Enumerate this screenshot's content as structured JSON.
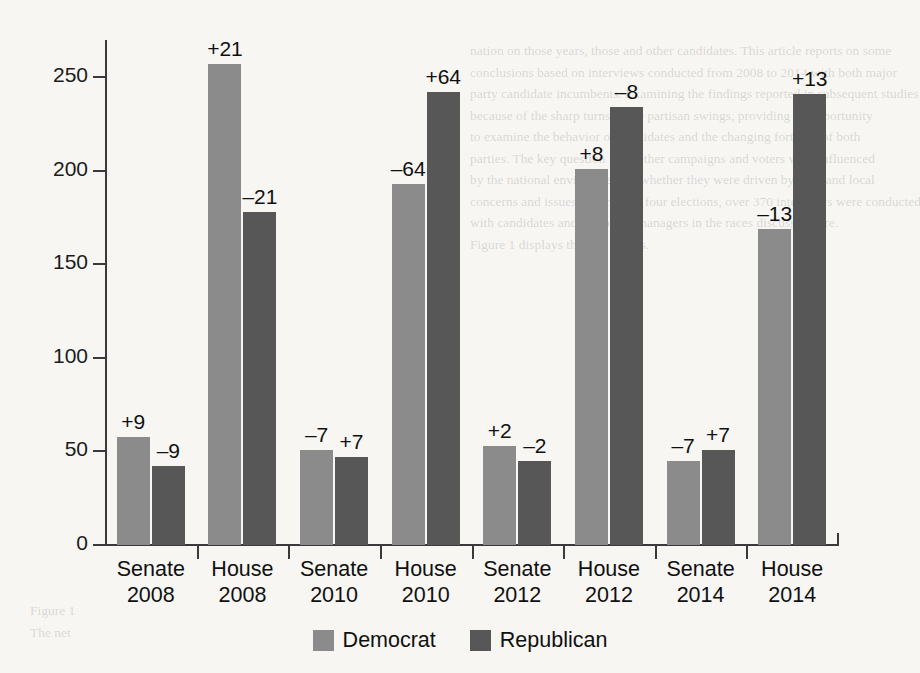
{
  "chart_data": {
    "type": "bar",
    "title": "",
    "xlabel": "",
    "ylabel": "",
    "ylim": [
      0,
      270
    ],
    "yticks": [
      0,
      50,
      100,
      150,
      200,
      250
    ],
    "grid": false,
    "legend_position": "bottom",
    "categories": [
      "Senate\n2008",
      "House\n2008",
      "Senate\n2010",
      "House\n2010",
      "Senate\n2012",
      "House\n2012",
      "Senate\n2014",
      "House\n2014"
    ],
    "category_lines": [
      {
        "chamber": "Senate",
        "year": "2008"
      },
      {
        "chamber": "House",
        "year": "2008"
      },
      {
        "chamber": "Senate",
        "year": "2010"
      },
      {
        "chamber": "House",
        "year": "2010"
      },
      {
        "chamber": "Senate",
        "year": "2012"
      },
      {
        "chamber": "House",
        "year": "2012"
      },
      {
        "chamber": "Senate",
        "year": "2014"
      },
      {
        "chamber": "House",
        "year": "2014"
      }
    ],
    "series": [
      {
        "name": "Democrat",
        "color": "#8b8b8b",
        "values": [
          58,
          257,
          51,
          193,
          53,
          201,
          45,
          169
        ],
        "point_labels": [
          "+9",
          "+21",
          "–7",
          "–64",
          "+2",
          "+8",
          "–7",
          "–13"
        ]
      },
      {
        "name": "Republican",
        "color": "#575757",
        "values": [
          42,
          178,
          47,
          242,
          45,
          234,
          51,
          241
        ],
        "point_labels": [
          "–9",
          "–21",
          "+7",
          "+64",
          "–2",
          "–8",
          "+7",
          "+13"
        ]
      }
    ]
  },
  "legend": {
    "items": [
      {
        "label": "Democrat",
        "color": "#8b8b8b"
      },
      {
        "label": "Republican",
        "color": "#575757"
      }
    ]
  },
  "background_bleed": {
    "top_right_lines": [
      "nation on those years, those and other candidates. This article reports on some",
      "conclusions based on interviews conducted from 2008 to 2014 with both major",
      "party candidate incumbents. Examining the findings reported in subsequent studies",
      "because of the sharp turns in the partisan swings, providing an opportunity",
      "to examine the behavior of candidates and the changing fortunes of both",
      "parties. The key question is whether campaigns and voters were influenced",
      "by the national environment or whether they were driven by state and local",
      "concerns and issues. Over these four elections, over 370 interviews were conducted",
      "with candidates and campaign managers in the races discussed here.",
      "Figure 1 displays the seat counts."
    ],
    "bottom_left_lines": [
      "Figure 1",
      "The net"
    ]
  }
}
